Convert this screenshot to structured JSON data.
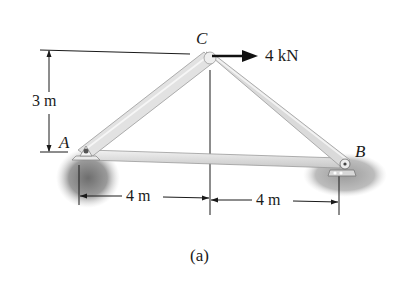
{
  "figure": {
    "caption": "(a)",
    "points": {
      "A": {
        "label": "A"
      },
      "B": {
        "label": "B"
      },
      "C": {
        "label": "C"
      }
    },
    "load": {
      "label": "4 kN",
      "direction": "right",
      "at": "C"
    },
    "dimensions": {
      "height": "3 m",
      "left_span": "4 m",
      "right_span": "4 m"
    },
    "colors": {
      "member_fill": "#e4e4e4",
      "member_edge": "#9a9a9a",
      "support_shadow": "#8a8a8a",
      "ink": "#1a1a1a"
    }
  }
}
